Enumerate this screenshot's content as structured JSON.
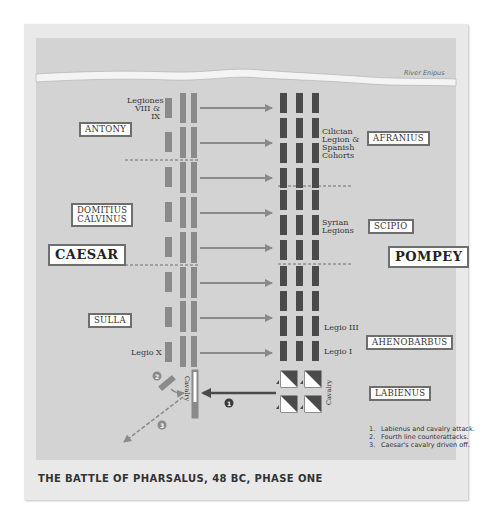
{
  "title": "THE BATTLE OF PHARSALUS, 48 BC, PHASE ONE",
  "river": {
    "label": "River Enipus"
  },
  "sides": {
    "caesar": {
      "label": "CAESAR"
    },
    "pompey": {
      "label": "POMPEY"
    }
  },
  "commanders": {
    "antony": "ANTONY",
    "domitius": [
      "DOMITIUS",
      "CALVINUS"
    ],
    "sulla": "SULLA",
    "afranius": "AFRANIUS",
    "scipio": "SCIPIO",
    "ahenobarbus": "AHENOBARBUS",
    "labienus": "LABIENUS"
  },
  "unit_labels": {
    "legiones_viii_ix": [
      "Legiones",
      "VIII & IX"
    ],
    "legio_x": "Legio X",
    "cilician": [
      "Cilician",
      "Legion &",
      "Spanish",
      "Cohorts"
    ],
    "syrian": [
      "Syrian",
      "Legions"
    ],
    "legio_iii": "Legio III",
    "legio_i": "Legio I",
    "caesar_cavalry": "Cavalry",
    "pompey_cavalry": "Cavalry"
  },
  "markers": [
    "1",
    "2",
    "3"
  ],
  "legend": [
    {
      "num": "1.",
      "text": "Labienus and cavalry attack."
    },
    {
      "num": "2.",
      "text": "Fourth line counterattacks."
    },
    {
      "num": "3.",
      "text": "Caesar's cavalry driven off."
    }
  ],
  "colors": {
    "map_bg": "#d3d3d3",
    "caesar_units": "#8a8a8a",
    "pompey_units": "#4a4a4a",
    "arrow": "#8a8a8a",
    "attack_arrow": "#4a4a4a"
  }
}
